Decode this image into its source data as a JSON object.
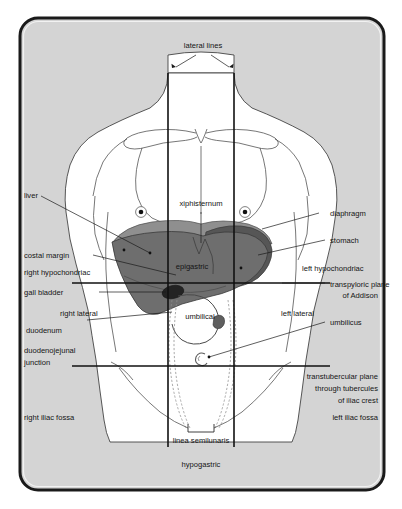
{
  "figure": {
    "background_color": "#d4d4d4",
    "frame_color": "#1a1a1a",
    "page_color": "#ffffff",
    "organ_colors": {
      "liver": "#6e6e6e",
      "diaphragm": "#8c8c8c",
      "stomach": "#5a5a5a",
      "gall_bladder": "#2e2e2e",
      "body_fill": "#ffffff"
    }
  },
  "labels": {
    "top": {
      "lateral_lines": "lateral lines"
    },
    "left": [
      {
        "id": "liver",
        "text": "liver"
      },
      {
        "id": "costal-margin",
        "text": "costal margin"
      },
      {
        "id": "right-hypochondriac",
        "text": "right hypochondriac"
      },
      {
        "id": "gall-bladder",
        "text": "gall bladder"
      },
      {
        "id": "right-lateral",
        "text": "right lateral"
      },
      {
        "id": "duodenum",
        "text": "duodenum"
      },
      {
        "id": "duodenojejunal-junction-line1",
        "text": "duodenojejunal"
      },
      {
        "id": "duodenojejunal-junction-line2",
        "text": "junction"
      },
      {
        "id": "right-iliac-fossa",
        "text": "right iliac fossa"
      }
    ],
    "right": [
      {
        "id": "diaphragm",
        "text": "diaphragm"
      },
      {
        "id": "stomach",
        "text": "stomach"
      },
      {
        "id": "left-hypochondriac",
        "text": "left hypochondriac"
      },
      {
        "id": "transpyloric-plane-line1",
        "text": "transpyloric plane"
      },
      {
        "id": "transpyloric-plane-line2",
        "text": "of Addison"
      },
      {
        "id": "left-lateral",
        "text": "left lateral"
      },
      {
        "id": "umbilicus",
        "text": "umbilicus"
      },
      {
        "id": "transtubercular-line1",
        "text": "transtubercular plane"
      },
      {
        "id": "transtubercular-line2",
        "text": "through tubercules"
      },
      {
        "id": "transtubercular-line3",
        "text": "of iliac crest"
      },
      {
        "id": "left-iliac-fossa",
        "text": "left iliac fossa"
      }
    ],
    "center": [
      {
        "id": "xiphisternum",
        "text": "xiphisternum"
      },
      {
        "id": "epigastric",
        "text": "epigastric"
      },
      {
        "id": "umbilical",
        "text": "umbilical"
      },
      {
        "id": "linea-semilunaris",
        "text": "linea semilunaris"
      },
      {
        "id": "hypogastric",
        "text": "hypogastric"
      }
    ]
  }
}
